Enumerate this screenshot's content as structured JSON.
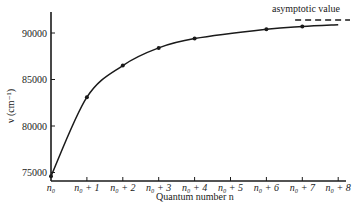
{
  "chart_data": {
    "type": "line",
    "title": "",
    "xlabel": "Quantum number n",
    "ylabel": "ν (cm⁻¹)",
    "categories": [
      "n₀",
      "n₀ + 1",
      "n₀ + 2",
      "n₀ + 3",
      "n₀ + 4",
      "n₀ + 5",
      "n₀ + 6",
      "n₀ + 7",
      "n₀ + 8"
    ],
    "y_ticks": [
      75000,
      80000,
      85000,
      90000
    ],
    "y_tick_labels": [
      "75000",
      "80000",
      "85000",
      "90000"
    ],
    "ylim": [
      74500,
      92000
    ],
    "grid": false,
    "legend": null,
    "series": [
      {
        "name": "Observed wavenumbers",
        "style": "smooth curve with point markers",
        "points": [
          {
            "x": 0,
            "y": 74600
          },
          {
            "x": 1,
            "y": 83100
          },
          {
            "x": 2,
            "y": 86500
          },
          {
            "x": 3,
            "y": 88400
          },
          {
            "x": 4,
            "y": 89400
          },
          {
            "x": 6,
            "y": 90400
          },
          {
            "x": 7,
            "y": 90700
          }
        ],
        "curve_end": {
          "x": 8,
          "y": 90900
        }
      }
    ],
    "annotations": [
      {
        "type": "dashed-hline",
        "y": 91400,
        "x_range": [
          6.8,
          8.8
        ],
        "label": "asymptotic value"
      }
    ]
  },
  "labels": {
    "y_axis_title": "ν (cm⁻¹)",
    "x_axis_title": "Quantum number n",
    "asymptote": "asymptotic value",
    "caption": "Figure 10.1"
  }
}
